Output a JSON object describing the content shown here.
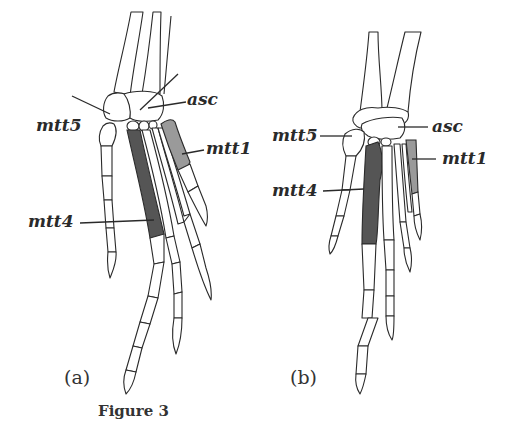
{
  "figure": {
    "caption": "Figure 3",
    "panels": [
      {
        "id": "a",
        "label": "(a)",
        "annotations": [
          "asc",
          "mtt5",
          "mtt1",
          "mtt4"
        ]
      },
      {
        "id": "b",
        "label": "(b)",
        "annotations": [
          "asc",
          "mtt5",
          "mtt1",
          "mtt4"
        ]
      }
    ],
    "highlight_colors": {
      "mtt4": "#555555",
      "mtt1": "#9a9a9a"
    }
  }
}
